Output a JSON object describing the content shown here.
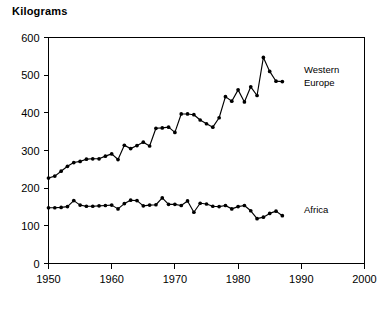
{
  "chart_data": {
    "type": "line",
    "title": "Kilograms",
    "xlabel": "",
    "ylabel": "Kilograms",
    "xlim": [
      1950,
      2000
    ],
    "ylim": [
      0,
      600
    ],
    "xticks": [
      1950,
      1960,
      1970,
      1980,
      1990,
      2000
    ],
    "yticks": [
      0,
      100,
      200,
      300,
      400,
      500,
      600
    ],
    "grid": false,
    "legend_position": "inline-right",
    "annotations": [
      "Western Europe",
      "Africa"
    ],
    "series": [
      {
        "name": "Western Europe",
        "label": "Western\nEurope",
        "label_line1": "Western",
        "label_line2": "Europe",
        "color": "#000000",
        "x": [
          1950,
          1951,
          1952,
          1953,
          1954,
          1955,
          1956,
          1957,
          1958,
          1959,
          1960,
          1961,
          1962,
          1963,
          1964,
          1965,
          1966,
          1967,
          1968,
          1969,
          1970,
          1971,
          1972,
          1973,
          1974,
          1975,
          1976,
          1977,
          1978,
          1979,
          1980,
          1981,
          1982,
          1983,
          1984,
          1985,
          1986,
          1987
        ],
        "values": [
          227,
          232,
          245,
          258,
          268,
          271,
          277,
          278,
          278,
          285,
          291,
          276,
          314,
          305,
          313,
          322,
          312,
          359,
          360,
          362,
          348,
          397,
          397,
          395,
          381,
          371,
          362,
          387,
          443,
          431,
          461,
          429,
          469,
          446,
          547,
          510,
          484,
          483
        ]
      },
      {
        "name": "Africa",
        "label": "Africa",
        "color": "#000000",
        "x": [
          1950,
          1951,
          1952,
          1953,
          1954,
          1955,
          1956,
          1957,
          1958,
          1959,
          1960,
          1961,
          1962,
          1963,
          1964,
          1965,
          1966,
          1967,
          1968,
          1969,
          1970,
          1971,
          1972,
          1973,
          1974,
          1975,
          1976,
          1977,
          1978,
          1979,
          1980,
          1981,
          1982,
          1983,
          1984,
          1985,
          1986,
          1987
        ],
        "values": [
          148,
          148,
          149,
          151,
          167,
          155,
          152,
          152,
          153,
          154,
          155,
          145,
          159,
          168,
          167,
          153,
          155,
          156,
          174,
          157,
          157,
          154,
          166,
          136,
          160,
          158,
          152,
          151,
          154,
          145,
          151,
          154,
          140,
          119,
          123,
          133,
          139,
          127
        ]
      }
    ]
  }
}
